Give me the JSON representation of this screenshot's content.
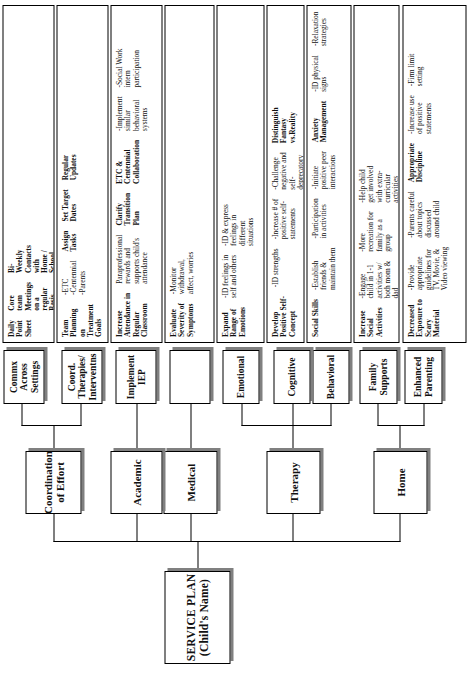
{
  "chart": {
    "orientation": "rotated-90-ccw",
    "root": {
      "line1": "SERVICE PLAN",
      "line2": "(Child's Name)"
    },
    "tier1": [
      {
        "id": "home",
        "label": "Home"
      },
      {
        "id": "therapy",
        "label": "Therapy"
      },
      {
        "id": "medical",
        "label": "Medical"
      },
      {
        "id": "academic",
        "label": "Academic"
      },
      {
        "id": "coordination",
        "line1": "Coordination",
        "line2": "of Effort"
      }
    ],
    "tier2": [
      {
        "id": "enhanced-parenting",
        "parent": "home",
        "line1": "Enhanced",
        "line2": "Parenting"
      },
      {
        "id": "family-supports",
        "parent": "home",
        "line1": "Family",
        "line2": "Supports"
      },
      {
        "id": "behavioral",
        "parent": "therapy",
        "line1": "Behavioral",
        "line2": ""
      },
      {
        "id": "cognitive",
        "parent": "therapy",
        "line1": "Cognitive",
        "line2": ""
      },
      {
        "id": "emotional",
        "parent": "therapy",
        "line1": "Emotional",
        "line2": ""
      },
      {
        "id": "medical-blank",
        "parent": "medical",
        "line1": "",
        "line2": ""
      },
      {
        "id": "implement-iep",
        "parent": "academic",
        "line1": "Implement",
        "line2": "IEP"
      },
      {
        "id": "coord-therapies",
        "parent": "coordination",
        "line1": "Coord.",
        "line2": "Therapies/",
        "line3": "Interventns"
      },
      {
        "id": "commx-across",
        "parent": "coordination",
        "line1": "Commx",
        "line2": "Across",
        "line3": "Settings"
      }
    ],
    "leaves": [
      {
        "id": "leaf-enhanced-parenting",
        "parent": "enhanced-parenting",
        "blocks": [
          {
            "type": "heading",
            "lines": [
              "Decreased",
              "Exposure to",
              "Scary",
              "Material"
            ]
          },
          {
            "type": "bullet",
            "lines": [
              "-Provide",
              "appropriate",
              "guidelines for",
              "TV, Movie, &",
              "Video viewing"
            ]
          },
          {
            "type": "bullet",
            "lines": [
              "-Parents careful",
              "about topics",
              "discussed",
              "around child"
            ]
          },
          {
            "type": "heading",
            "lines": [
              "Appropriate",
              "Discipline"
            ]
          },
          {
            "type": "bullet",
            "lines": [
              "-Increase use",
              "of positive",
              "statements"
            ]
          },
          {
            "type": "bullet",
            "lines": [
              "-Firm limit",
              "setting"
            ]
          }
        ]
      },
      {
        "id": "leaf-family-supports",
        "parent": "family-supports",
        "blocks": [
          {
            "type": "heading",
            "lines": [
              "Increase",
              "Social",
              "Activities"
            ]
          },
          {
            "type": "bullet",
            "lines": [
              "-Engage",
              "child in 1-1",
              "activities w/",
              "both mom &",
              "dad"
            ]
          },
          {
            "type": "bullet",
            "lines": [
              "-More",
              "recreation for",
              "family as a",
              "group"
            ]
          },
          {
            "type": "bullet",
            "lines": [
              "-Help child",
              "get involved",
              "with extra-",
              "curricular",
              "activities"
            ]
          }
        ]
      },
      {
        "id": "leaf-behavioral",
        "parent": "behavioral",
        "blocks": [
          {
            "type": "heading",
            "lines": [
              "Social Skills"
            ]
          },
          {
            "type": "bullet",
            "lines": [
              "-Establish",
              "friends &",
              "maintain them"
            ]
          },
          {
            "type": "bullet",
            "lines": [
              "-Participation",
              "in activities"
            ]
          },
          {
            "type": "bullet",
            "lines": [
              "-Initiate",
              "positive peer",
              "interactions"
            ]
          },
          {
            "type": "heading",
            "lines": [
              "Anxiety",
              "Management"
            ]
          },
          {
            "type": "bullet",
            "lines": [
              "-ID physical",
              "signs"
            ]
          },
          {
            "type": "bullet",
            "lines": [
              "-Relaxation",
              "strategies"
            ]
          },
          {
            "type": "bullet",
            "lines": [
              "-Coping",
              "Strategies"
            ]
          },
          {
            "type": "heading",
            "lines": [
              "Circle of",
              "Friends"
            ]
          }
        ]
      },
      {
        "id": "leaf-cognitive",
        "parent": "cognitive",
        "blocks": [
          {
            "type": "heading",
            "lines": [
              "Develop",
              "Positive Self-",
              "Concept"
            ]
          },
          {
            "type": "bullet",
            "lines": [
              "-ID strengths"
            ]
          },
          {
            "type": "bullet",
            "lines": [
              "-Increase # of",
              "positive self-",
              "statements"
            ]
          },
          {
            "type": "bullet",
            "lines": [
              "-Challenge",
              "negative and",
              "self-",
              "deprecatory",
              "thoughts"
            ]
          },
          {
            "type": "heading",
            "lines": [
              "Distinguish",
              "Fantasy",
              "vs.Reality"
            ]
          }
        ]
      },
      {
        "id": "leaf-emotional",
        "parent": "emotional",
        "blocks": [
          {
            "type": "heading",
            "lines": [
              "Expand",
              "Range of",
              "Emotions"
            ]
          },
          {
            "type": "bullet",
            "lines": [
              "-ID feelings in",
              "self and others"
            ]
          },
          {
            "type": "bullet",
            "lines": [
              "-ID & express",
              "feelings in",
              "different",
              "situations"
            ]
          }
        ]
      },
      {
        "id": "leaf-medical",
        "parent": "medical-blank",
        "blocks": [
          {
            "type": "heading",
            "lines": [
              "Evaluate",
              "Severity of",
              "Symptoms"
            ]
          },
          {
            "type": "bullet",
            "lines": [
              "-Monitor",
              "withdrawal,",
              "affect, worries"
            ]
          }
        ]
      },
      {
        "id": "leaf-academic",
        "parent": "implement-iep",
        "blocks": [
          {
            "type": "heading",
            "lines": [
              "Increase",
              "Attendance in",
              "Regular",
              "Classroom"
            ]
          },
          {
            "type": "bullet",
            "lines": [
              "Paraprofessional",
              "rewards and",
              "supports child's",
              "attendance"
            ]
          },
          {
            "type": "heading",
            "lines": [
              "Clarify",
              "Transition",
              "Plan"
            ]
          },
          {
            "type": "heading",
            "lines": [
              "ETC &",
              "Centennial",
              "Collaboration"
            ]
          },
          {
            "type": "bullet",
            "lines": [
              "-Implement",
              "similar",
              "behavioral",
              "systems"
            ]
          },
          {
            "type": "bullet",
            "lines": [
              "-Social Work",
              "intern",
              "participation"
            ]
          }
        ]
      },
      {
        "id": "leaf-coord-therapies",
        "parent": "coord-therapies",
        "blocks": [
          {
            "type": "heading",
            "lines": [
              "Team",
              "Planning",
              "on",
              "Treatment",
              "Goals"
            ]
          },
          {
            "type": "bullet",
            "lines": [
              "-ETC",
              "-Centennial",
              "-Parents"
            ]
          },
          {
            "type": "heading",
            "lines": [
              "Assign",
              "Tasks"
            ]
          },
          {
            "type": "heading",
            "lines": [
              "Set Target",
              "Dates"
            ]
          },
          {
            "type": "heading",
            "lines": [
              "Regular",
              "Updates"
            ]
          }
        ]
      },
      {
        "id": "leaf-commx",
        "parent": "commx-across",
        "blocks": [
          {
            "type": "heading",
            "lines": [
              "Daily",
              "Point",
              "Sheet"
            ]
          },
          {
            "type": "heading",
            "lines": [
              "Core",
              "team",
              "Meetings",
              "on a",
              "regular",
              "Basis"
            ]
          },
          {
            "type": "heading",
            "lines": [
              "Bi-",
              "Weekly",
              "Contacts",
              "with",
              "Home /",
              "School"
            ]
          }
        ]
      }
    ],
    "colors": {
      "box_border": "#000000",
      "box_fill": "#ffffff",
      "box_shadow": "#808080",
      "connector": "#000000",
      "text": "#111111"
    }
  }
}
